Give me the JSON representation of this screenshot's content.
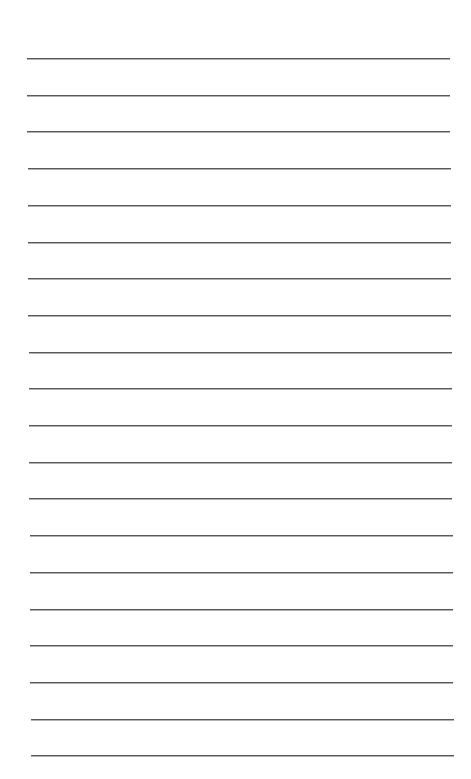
{
  "page": {
    "type": "lined-paper",
    "background_color": "#ffffff",
    "line_color": "#5a5a5a",
    "line_count": 20,
    "first_line_y": 58,
    "line_spacing": 36.7,
    "line_left_x": 27,
    "line_right_x": 450,
    "text": ""
  }
}
